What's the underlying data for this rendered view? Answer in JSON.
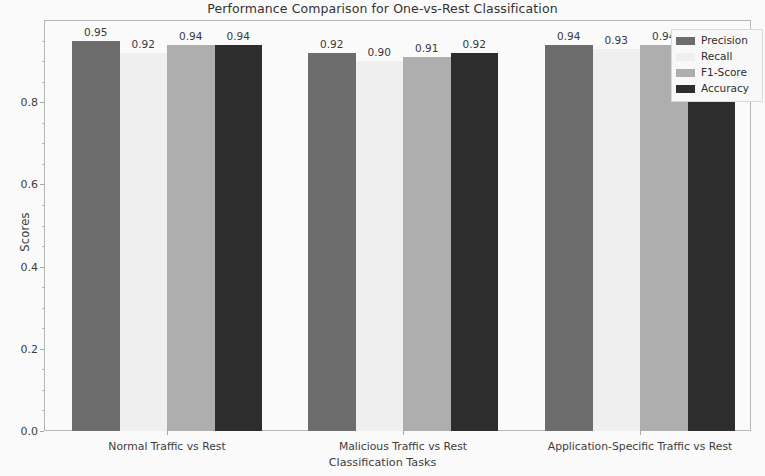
{
  "chart_data": {
    "type": "bar",
    "title": "Performance Comparison for One-vs-Rest Classification",
    "xlabel": "Classification Tasks",
    "ylabel": "Scores",
    "categories": [
      "Normal Traffic vs Rest",
      "Malicious Traffic vs Rest",
      "Application-Specific Traffic vs Rest"
    ],
    "series": [
      {
        "name": "Precision",
        "color": "#6e6e6e",
        "values": [
          0.95,
          0.92,
          0.94
        ]
      },
      {
        "name": "Recall",
        "color": "#f2f2f2",
        "values": [
          0.92,
          0.9,
          0.93
        ]
      },
      {
        "name": "F1-Score",
        "color": "#b0b0b0",
        "values": [
          0.94,
          0.91,
          0.94
        ]
      },
      {
        "name": "Accuracy",
        "color": "#2e2e2e",
        "values": [
          0.94,
          0.92,
          0.94
        ]
      }
    ],
    "value_labels": [
      [
        "0.95",
        "0.92",
        "0.94",
        "0.94"
      ],
      [
        "0.92",
        "0.90",
        "0.91",
        "0.92"
      ],
      [
        "0.94",
        "0.93",
        "0.94",
        ""
      ]
    ],
    "yticks": [
      "0.0",
      "0.2",
      "0.4",
      "0.6",
      "0.8"
    ],
    "ytick_values": [
      0.0,
      0.2,
      0.4,
      0.6,
      0.8
    ],
    "ylim": [
      0.0,
      1.0
    ],
    "grid": false,
    "legend_position": "upper right",
    "legend_entries": [
      "Precision",
      "Recall",
      "F1-Score",
      "Accuracy"
    ]
  },
  "figure": {
    "background": "#fdfdfd",
    "frame_color": "#b9b9b9"
  }
}
